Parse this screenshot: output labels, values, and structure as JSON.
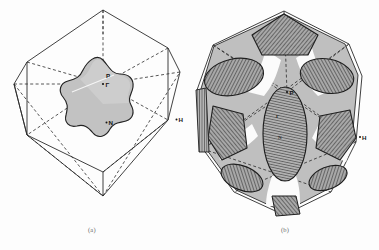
{
  "figure": {
    "background_color": "#fdfdfd",
    "ink_color": "#2b2b2b",
    "panels": [
      {
        "id": "a",
        "caption": "(a)",
        "description": "Body-centred-cubic Brillouin zone (truncated octahedron) drawn in outline with dashed hidden edges, containing a small shaded star-shaped closed Fermi surface centred at Gamma.",
        "zone_shape": "truncated-octahedron",
        "surface_shape": "star-shaped-closed-pocket",
        "surface_fill": "#c9c9c9",
        "labels": [
          {
            "text": "P",
            "point": "P"
          },
          {
            "text": "Γ",
            "point": "Gamma"
          },
          {
            "text": "N",
            "point": "N"
          },
          {
            "text": "H",
            "point": "H"
          }
        ]
      },
      {
        "id": "b",
        "caption": "(b)",
        "description": "Body-centred-cubic Brillouin zone filled by a large multiply-connected Fermi surface; cross-hatched elliptical and faceted caps mark the zone-face intersections, with a tall hatched lens along the vertical axis.",
        "zone_shape": "truncated-octahedron",
        "surface_shape": "multiply-connected",
        "surface_fill": "#bcbcbc",
        "hatch_fill": "#9a9a9a",
        "labels": [
          {
            "text": "P",
            "point": "P"
          },
          {
            "text": "Γ",
            "point": "Gamma"
          },
          {
            "text": "N",
            "point": "N"
          },
          {
            "text": "H",
            "point": "H"
          }
        ]
      }
    ]
  }
}
